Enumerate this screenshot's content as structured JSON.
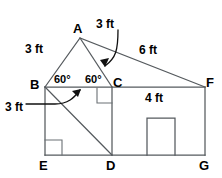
{
  "figure": {
    "stroke_color": "#555a5e",
    "label_color": "#000000",
    "background_color": "#ffffff"
  },
  "vertices": [
    {
      "name": "A",
      "label": "A",
      "x": 80,
      "y": 38,
      "label_x": 73,
      "label_y": 22
    },
    {
      "name": "B",
      "label": "B",
      "x": 45,
      "y": 87,
      "label_x": 30,
      "label_y": 78
    },
    {
      "name": "C",
      "label": "C",
      "x": 112,
      "y": 87,
      "label_x": 113,
      "label_y": 76
    },
    {
      "name": "D",
      "label": "D",
      "x": 112,
      "y": 155,
      "label_x": 106,
      "label_y": 159
    },
    {
      "name": "E",
      "label": "E",
      "x": 45,
      "y": 155,
      "label_x": 39,
      "label_y": 159
    },
    {
      "name": "F",
      "label": "F",
      "x": 205,
      "y": 87,
      "label_x": 206,
      "label_y": 76
    },
    {
      "name": "G",
      "label": "G",
      "x": 205,
      "y": 155,
      "label_x": 199,
      "label_y": 159
    }
  ],
  "dimensions": [
    {
      "name": "side-ba",
      "label": "3 ft",
      "x": 25,
      "y": 43,
      "refers_to": "segment B-A"
    },
    {
      "name": "side-ac",
      "label": "3 ft",
      "x": 96,
      "y": 18,
      "refers_to": "segment A-C"
    },
    {
      "name": "side-af",
      "label": "6 ft",
      "x": 139,
      "y": 44,
      "refers_to": "segment A-F"
    },
    {
      "name": "side-bd",
      "label": "3 ft",
      "x": 5,
      "y": 101,
      "refers_to": "segment B-D"
    },
    {
      "name": "side-cf",
      "label": "4 ft",
      "x": 145,
      "y": 92,
      "refers_to": "segment C-F"
    }
  ],
  "angles": [
    {
      "name": "angle-b",
      "label": "60°",
      "x": 54,
      "y": 74,
      "at_vertex": "B"
    },
    {
      "name": "angle-c",
      "label": "60°",
      "x": 85,
      "y": 74,
      "at_vertex": "C"
    }
  ],
  "right_angle_markers": [
    {
      "name": "right-angle-at-c",
      "x": 97,
      "y": 88,
      "width": 15,
      "height": 15
    },
    {
      "name": "right-angle-at-e",
      "x": 45,
      "y": 140,
      "width": 17,
      "height": 15
    }
  ],
  "door": {
    "name": "door-rectangle",
    "x": 147,
    "y": 118,
    "width": 28,
    "height": 37
  },
  "edges": [
    {
      "name": "edge-b-a",
      "from": "B",
      "to": "A"
    },
    {
      "name": "edge-a-c",
      "from": "A",
      "to": "C"
    },
    {
      "name": "edge-a-f",
      "from": "A",
      "to": "F"
    },
    {
      "name": "edge-b-c",
      "from": "B",
      "to": "C"
    },
    {
      "name": "edge-c-f",
      "from": "C",
      "to": "F"
    },
    {
      "name": "edge-b-e",
      "from": "B",
      "to": "E"
    },
    {
      "name": "edge-e-d",
      "from": "E",
      "to": "D"
    },
    {
      "name": "edge-d-g",
      "from": "D",
      "to": "G"
    },
    {
      "name": "edge-c-d",
      "from": "C",
      "to": "D"
    },
    {
      "name": "edge-f-g",
      "from": "F",
      "to": "G"
    },
    {
      "name": "edge-b-d",
      "from": "B",
      "to": "D"
    }
  ]
}
